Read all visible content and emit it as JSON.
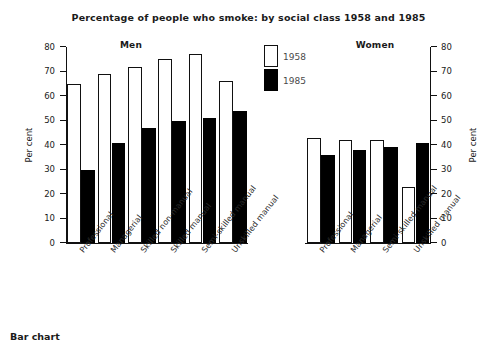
{
  "caption": "Bar chart",
  "chart_data": {
    "type": "bar",
    "title": "Percentage of people who smoke: by social class 1958 and 1985",
    "xlabel": "",
    "ylabel": "Per cent",
    "ylim": [
      0,
      80
    ],
    "ytick_labels": [
      "80",
      "70",
      "60",
      "50",
      "40",
      "30",
      "20",
      "10",
      "0"
    ],
    "ytick_values": [
      80,
      70,
      60,
      50,
      40,
      30,
      20,
      10,
      0
    ],
    "grid": false,
    "legend_position": "top-center",
    "legend": [
      {
        "label": "1958",
        "fill": "#ffffff",
        "edge": "#111111"
      },
      {
        "label": "1985",
        "fill": "#000000",
        "edge": "#000000"
      }
    ],
    "panels": [
      {
        "name": "Men",
        "categories": [
          "Professional",
          "Managerial",
          "Skilled non-manual",
          "Skilled manual",
          "Semi-skilled manual",
          "Unskilled manual"
        ],
        "series": [
          {
            "name": "1958",
            "values": [
              65,
              69,
              72,
              75,
              77,
              66
            ]
          },
          {
            "name": "1985",
            "values": [
              30,
              41,
              47,
              50,
              51,
              54
            ]
          }
        ]
      },
      {
        "name": "Women",
        "categories": [
          "Professional",
          "Managerial",
          "Semi-skilled manual",
          "Unskilled manual"
        ],
        "series": [
          {
            "name": "1958",
            "values": [
              43,
              42,
              42,
              23
            ]
          },
          {
            "name": "1985",
            "values": [
              36,
              38,
              39,
              41
            ]
          }
        ]
      }
    ],
    "axes": [
      {
        "side": "left",
        "label": "Per cent"
      },
      {
        "side": "right",
        "label": "Per cent"
      }
    ]
  }
}
